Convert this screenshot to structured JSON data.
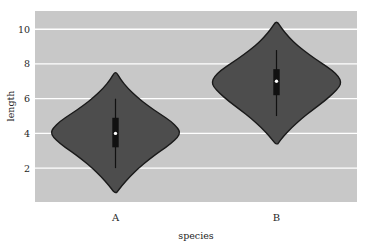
{
  "figure": {
    "background_color": "#ffffff",
    "axes_background_color": "#c8c8c8",
    "grid_color": "#ffffff",
    "violin_fill_color": "#4d4d4d",
    "violin_edge_color": "#1a1a1a",
    "box_color": "#111111",
    "whisker_color": "#111111",
    "median_color": "#ffffff"
  },
  "chart_data": {
    "type": "violin",
    "title": "",
    "xlabel": "species",
    "ylabel": "length",
    "categories": [
      "A",
      "B"
    ],
    "grid": true,
    "grid_axis": "y",
    "legend": false,
    "xlim": [
      -0.5,
      1.5
    ],
    "ylim": [
      0.05,
      11.05
    ],
    "yticks": [
      2,
      4,
      6,
      8,
      10
    ],
    "ytick_labels": [
      "2",
      "4",
      "6",
      "8",
      "10"
    ],
    "xtick_labels": [
      "A",
      "B"
    ],
    "series": [
      {
        "name": "A",
        "category": "A",
        "center_x": 0,
        "data_min": 0.6,
        "data_max": 7.5,
        "whisker_low": 2.0,
        "whisker_high": 6.0,
        "q1": 3.2,
        "median": 4.0,
        "q3": 4.9,
        "density": [
          {
            "value": 0.6,
            "width": 0.02
          },
          {
            "value": 1.0,
            "width": 0.1
          },
          {
            "value": 1.5,
            "width": 0.22
          },
          {
            "value": 2.0,
            "width": 0.36
          },
          {
            "value": 2.5,
            "width": 0.52
          },
          {
            "value": 3.0,
            "width": 0.7
          },
          {
            "value": 3.4,
            "width": 0.86
          },
          {
            "value": 3.8,
            "width": 0.97
          },
          {
            "value": 4.05,
            "width": 1.0
          },
          {
            "value": 4.3,
            "width": 0.97
          },
          {
            "value": 4.7,
            "width": 0.86
          },
          {
            "value": 5.1,
            "width": 0.7
          },
          {
            "value": 5.6,
            "width": 0.5
          },
          {
            "value": 6.1,
            "width": 0.33
          },
          {
            "value": 6.6,
            "width": 0.19
          },
          {
            "value": 7.1,
            "width": 0.08
          },
          {
            "value": 7.5,
            "width": 0.02
          }
        ]
      },
      {
        "name": "B",
        "category": "B",
        "center_x": 1,
        "data_min": 3.4,
        "data_max": 10.4,
        "whisker_low": 5.0,
        "whisker_high": 8.8,
        "q1": 6.2,
        "median": 7.0,
        "q3": 7.7,
        "density": [
          {
            "value": 3.4,
            "width": 0.02
          },
          {
            "value": 3.85,
            "width": 0.11
          },
          {
            "value": 4.35,
            "width": 0.24
          },
          {
            "value": 4.85,
            "width": 0.39
          },
          {
            "value": 5.35,
            "width": 0.56
          },
          {
            "value": 5.85,
            "width": 0.74
          },
          {
            "value": 6.3,
            "width": 0.88
          },
          {
            "value": 6.7,
            "width": 0.98
          },
          {
            "value": 6.95,
            "width": 1.0
          },
          {
            "value": 7.25,
            "width": 0.97
          },
          {
            "value": 7.65,
            "width": 0.86
          },
          {
            "value": 8.05,
            "width": 0.7
          },
          {
            "value": 8.55,
            "width": 0.5
          },
          {
            "value": 9.05,
            "width": 0.33
          },
          {
            "value": 9.55,
            "width": 0.19
          },
          {
            "value": 10.05,
            "width": 0.08
          },
          {
            "value": 10.4,
            "width": 0.02
          }
        ]
      }
    ]
  }
}
